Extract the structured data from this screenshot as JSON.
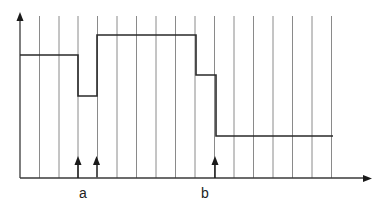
{
  "diagram": {
    "type": "step-signal-with-event-markers",
    "colors": {
      "grid": "#8a8a8a",
      "axis": "#3a3a3a",
      "signal": "#2a2a2a",
      "marker": "#1a1a1a",
      "background": "#ffffff"
    },
    "axes": {
      "x_axis": {
        "has_arrow": true
      },
      "y_axis": {
        "has_arrow": true
      }
    },
    "grid": {
      "vertical_lines": 16
    },
    "labels": {
      "a": "a",
      "b": "b"
    },
    "event_markers": [
      {
        "id": "marker-a1",
        "group": "a"
      },
      {
        "id": "marker-a2",
        "group": "a"
      },
      {
        "id": "marker-b",
        "group": "b"
      }
    ],
    "signal_levels": [
      {
        "segment": 1,
        "level": "high"
      },
      {
        "segment": 2,
        "level": "low"
      },
      {
        "segment": 3,
        "level": "highest"
      },
      {
        "segment": 4,
        "level": "medium"
      },
      {
        "segment": 5,
        "level": "lowest"
      }
    ]
  }
}
